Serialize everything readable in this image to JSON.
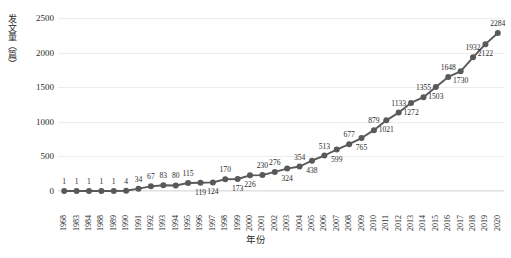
{
  "chart_data": {
    "type": "line",
    "title": "",
    "xlabel": "年份",
    "ylabel": "发文量（篇）",
    "ylim": [
      0,
      2500
    ],
    "yticks": [
      0,
      500,
      1000,
      1500,
      2000,
      2500
    ],
    "grid": true,
    "legend": "none",
    "marker": "circle",
    "series_color": "#595959",
    "categories": [
      "1968",
      "1983",
      "1984",
      "1988",
      "1989",
      "1990",
      "1991",
      "1992",
      "1993",
      "1994",
      "1995",
      "1996",
      "1997",
      "1998",
      "1999",
      "2000",
      "2001",
      "2002",
      "2003",
      "2004",
      "2005",
      "2006",
      "2007",
      "2008",
      "2009",
      "2010",
      "2011",
      "2012",
      "2013",
      "2014",
      "2015",
      "2016",
      "2017",
      "2018",
      "2019",
      "2020"
    ],
    "values": [
      1,
      1,
      1,
      1,
      1,
      4,
      34,
      67,
      83,
      80,
      115,
      119,
      124,
      170,
      173,
      226,
      230,
      276,
      324,
      354,
      438,
      513,
      599,
      677,
      765,
      879,
      1021,
      1133,
      1272,
      1355,
      1503,
      1648,
      1730,
      1932,
      2122,
      2284
    ],
    "label_positions": [
      "above",
      "above",
      "above",
      "above",
      "above",
      "above",
      "above",
      "above",
      "above",
      "above",
      "above",
      "below",
      "below",
      "above",
      "below",
      "below",
      "above",
      "above",
      "below",
      "above",
      "below",
      "above",
      "below",
      "above",
      "below",
      "above",
      "below",
      "above",
      "below",
      "above",
      "below",
      "above",
      "below",
      "above",
      "below",
      "above"
    ]
  },
  "axis": {
    "y_title": "发文量（篇）",
    "x_title": "年份"
  }
}
